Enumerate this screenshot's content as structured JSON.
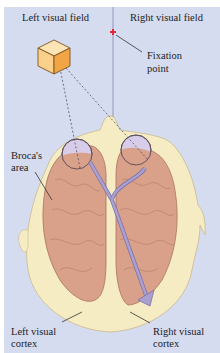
{
  "labels": {
    "left_visual_field": "Left visual field",
    "right_visual_field": "Right visual field",
    "fixation_point_line1": "Fixation",
    "fixation_point_line2": "point",
    "brocas_area_line1": "Broca's",
    "brocas_area_line2": "area",
    "left_visual_cortex_line1": "Left visual",
    "left_visual_cortex_line2": "cortex",
    "right_visual_cortex_line1": "Right visual",
    "right_visual_cortex_line2": "cortex"
  },
  "colors": {
    "background": "#d5dcf0",
    "head": "#f6ecc4",
    "brain": "#d9a08a",
    "cube_light": "#fbd08a",
    "cube_dark": "#f2a545",
    "fixation_point": "#e8283c",
    "pathway": "#a9a0d0"
  }
}
